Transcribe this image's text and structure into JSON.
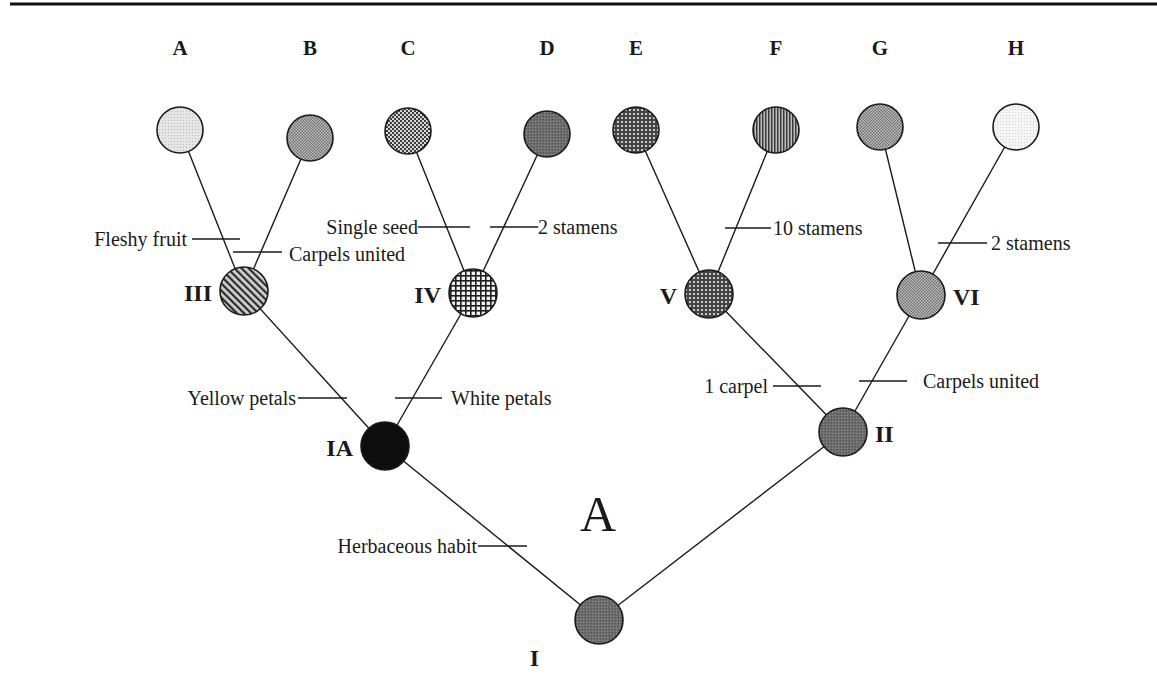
{
  "figure": {
    "panel_label": "A",
    "top_rule": true
  },
  "tips": [
    {
      "id": "A",
      "label": "A",
      "x": 180,
      "y": 130,
      "pattern": "light-dots"
    },
    {
      "id": "B",
      "label": "B",
      "x": 310,
      "y": 138,
      "pattern": "fine-checker"
    },
    {
      "id": "C",
      "label": "C",
      "x": 408,
      "y": 131,
      "pattern": "checker"
    },
    {
      "id": "D",
      "label": "D",
      "x": 547,
      "y": 134,
      "pattern": "dark-dots"
    },
    {
      "id": "E",
      "label": "E",
      "x": 636,
      "y": 130,
      "pattern": "grid-dark"
    },
    {
      "id": "F",
      "label": "F",
      "x": 776,
      "y": 130,
      "pattern": "vertical-lines"
    },
    {
      "id": "G",
      "label": "G",
      "x": 880,
      "y": 127,
      "pattern": "fine-checker"
    },
    {
      "id": "H",
      "label": "H",
      "x": 1016,
      "y": 127,
      "pattern": "very-light-dots"
    }
  ],
  "internal_nodes": [
    {
      "id": "III",
      "label": "III",
      "x": 244,
      "y": 291,
      "pattern": "diagonal-lines",
      "label_side": "left"
    },
    {
      "id": "IV",
      "label": "IV",
      "x": 473,
      "y": 293,
      "pattern": "crosshatch-grid",
      "label_side": "left"
    },
    {
      "id": "V",
      "label": "V",
      "x": 709,
      "y": 294,
      "pattern": "grid-dark",
      "label_side": "left"
    },
    {
      "id": "VI",
      "label": "VI",
      "x": 921,
      "y": 295,
      "pattern": "fine-checker",
      "label_side": "right"
    },
    {
      "id": "IA",
      "label": "IA",
      "x": 385,
      "y": 446,
      "pattern": "solid-black",
      "label_side": "left"
    },
    {
      "id": "II",
      "label": "II",
      "x": 843,
      "y": 432,
      "pattern": "dark-dots",
      "label_side": "right"
    },
    {
      "id": "I",
      "label": "I",
      "x": 599,
      "y": 620,
      "pattern": "dark-dots",
      "label_side": "left"
    }
  ],
  "edges": [
    [
      "III",
      "A"
    ],
    [
      "III",
      "B"
    ],
    [
      "IV",
      "C"
    ],
    [
      "IV",
      "D"
    ],
    [
      "V",
      "E"
    ],
    [
      "V",
      "F"
    ],
    [
      "VI",
      "G"
    ],
    [
      "VI",
      "H"
    ],
    [
      "IA",
      "III"
    ],
    [
      "IA",
      "IV"
    ],
    [
      "II",
      "V"
    ],
    [
      "II",
      "VI"
    ],
    [
      "I",
      "IA"
    ],
    [
      "I",
      "II"
    ]
  ],
  "characters": [
    {
      "text": "Fleshy fruit",
      "branch": "III-A",
      "tick": [
        192,
        239,
        240,
        239
      ],
      "text_x": 187,
      "text_y": 246,
      "anchor": "end"
    },
    {
      "text": "Carpels united",
      "branch": "III-B",
      "tick": [
        233,
        252,
        282,
        252
      ],
      "text_x": 289,
      "text_y": 261,
      "anchor": "start"
    },
    {
      "text": "Single seed",
      "branch": "IV-C",
      "tick": [
        418,
        227,
        470,
        227
      ],
      "text_x": 418,
      "text_y": 234,
      "anchor": "end"
    },
    {
      "text": "2 stamens",
      "branch": "IV-D",
      "tick": [
        490,
        227,
        538,
        227
      ],
      "text_x": 538,
      "text_y": 234,
      "anchor": "start"
    },
    {
      "text": "10 stamens",
      "branch": "V-F",
      "tick": [
        725,
        228,
        771,
        228
      ],
      "text_x": 773,
      "text_y": 235,
      "anchor": "start"
    },
    {
      "text": "2 stamens",
      "branch": "VI-H",
      "tick": [
        938,
        243,
        987,
        243
      ],
      "text_x": 991,
      "text_y": 250,
      "anchor": "start"
    },
    {
      "text": "Yellow petals",
      "branch": "IA-III",
      "tick": [
        298,
        398,
        347,
        398
      ],
      "text_x": 296,
      "text_y": 405,
      "anchor": "end"
    },
    {
      "text": "White petals",
      "branch": "IA-IV",
      "tick": [
        395,
        398,
        442,
        398
      ],
      "text_x": 451,
      "text_y": 405,
      "anchor": "start"
    },
    {
      "text": "1 carpel",
      "branch": "II-V",
      "tick": [
        773,
        386,
        821,
        386
      ],
      "text_x": 768,
      "text_y": 393,
      "anchor": "end"
    },
    {
      "text": "Carpels united",
      "branch": "II-VI",
      "tick": [
        859,
        381,
        907,
        381
      ],
      "text_x": 923,
      "text_y": 388,
      "anchor": "start"
    },
    {
      "text": "Herbaceous habit",
      "branch": "I-IA",
      "tick": [
        478,
        546,
        527,
        546
      ],
      "text_x": 477,
      "text_y": 553,
      "anchor": "end"
    }
  ]
}
